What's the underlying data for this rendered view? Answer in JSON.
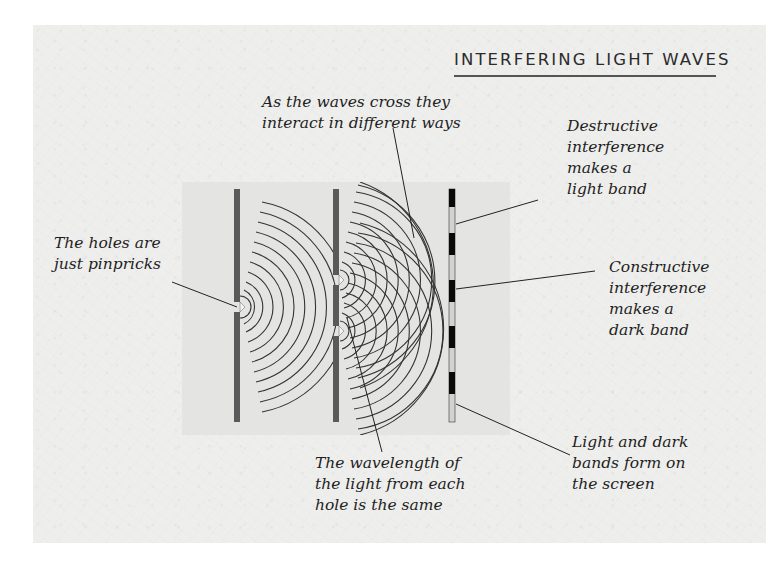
{
  "title": "INTERFERING LIGHT WAVES",
  "colors": {
    "paper": "#eeeeec",
    "panel": "#e4e4e2",
    "barrier": "#5a5a5a",
    "dark_band": "#0a0a0a",
    "light_band": "#d2d2d2",
    "wave": "#333333",
    "text": "#1e1e1e"
  },
  "labels": {
    "waves_cross": [
      "As the waves cross they",
      "interact in different ways"
    ],
    "destructive": [
      "Destructive",
      "interference",
      "makes a",
      "light band"
    ],
    "holes": [
      "The holes are",
      "just pinpricks"
    ],
    "constructive": [
      "Constructive",
      "interference",
      "makes a",
      "dark band"
    ],
    "wavelength": [
      "The wavelength of",
      "the light from each",
      "hole is the same"
    ],
    "bands": [
      "Light and dark",
      "bands form on",
      "the screen"
    ]
  },
  "diagram": {
    "components": [
      "single-slit barrier",
      "double-slit barrier",
      "screen with interference bands"
    ],
    "screen_bands": [
      "dark",
      "light",
      "dark",
      "light",
      "dark",
      "light",
      "dark",
      "light",
      "dark",
      "light"
    ]
  }
}
